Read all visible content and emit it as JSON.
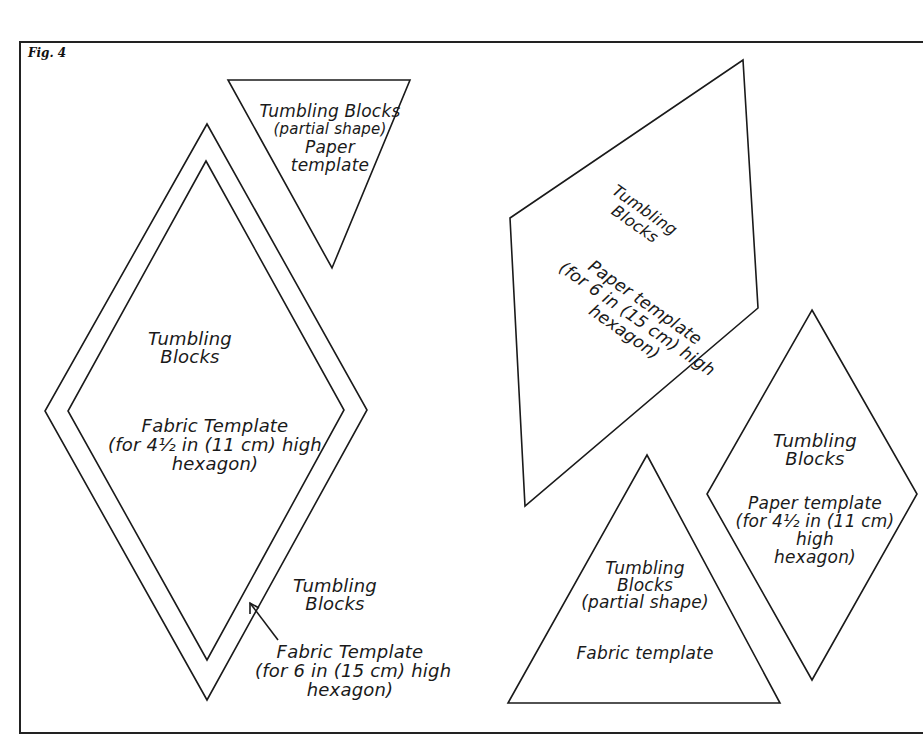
{
  "figure": {
    "label": "Fig. 4"
  },
  "colors": {
    "background": "#ffffff",
    "stroke": "#1a1a1a"
  },
  "templates": {
    "top_triangle": {
      "lines": [
        "Tumbling Blocks",
        "(partial shape)",
        "Paper",
        "template"
      ]
    },
    "large_diamond_inner": {
      "title": [
        "Tumbling",
        "Blocks"
      ],
      "desc": [
        "Fabric Template",
        "(for 4½ in (11 cm) high",
        "hexagon)"
      ]
    },
    "large_diamond_outer": {
      "title": [
        "Tumbling",
        "Blocks"
      ],
      "desc": [
        "Fabric Template",
        "(for 6 in (15 cm) high",
        "hexagon)"
      ]
    },
    "parallelogram": {
      "title": [
        "Tumbling",
        "Blocks"
      ],
      "desc": [
        "Paper template",
        "(for 6 in (15 cm) high",
        "hexagon)"
      ]
    },
    "bottom_triangle": {
      "lines": [
        "Tumbling",
        "Blocks",
        "(partial shape)"
      ],
      "desc": "Fabric template"
    },
    "small_diamond": {
      "title": [
        "Tumbling",
        "Blocks"
      ],
      "desc": [
        "Paper template",
        "(for 4½ in (11 cm)",
        "high",
        "hexagon)"
      ]
    }
  }
}
